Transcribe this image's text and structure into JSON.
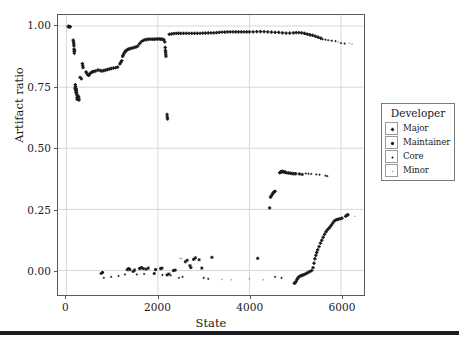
{
  "chart_data": {
    "type": "scatter",
    "title": "",
    "xlabel": "State",
    "ylabel": "Artifact ratio",
    "xlim": [
      -180,
      6500
    ],
    "ylim": [
      -0.1,
      1.045
    ],
    "xticks": [
      0,
      2000,
      4000,
      6000
    ],
    "xticklabels": [
      "0",
      "2000",
      "4000",
      "6000"
    ],
    "yticks": [
      0.0,
      0.25,
      0.5,
      0.75,
      1.0
    ],
    "yticklabels": [
      "0.00",
      "0.25",
      "0.50",
      "0.75",
      "1.00"
    ],
    "grid": true,
    "grid_color": "#d7d7d7",
    "marker_color": "#1a1a1a",
    "legend": {
      "title": "Developer",
      "position": "right-outside",
      "entries": [
        {
          "label": "Major",
          "marker": "plus-bold",
          "size": 3.2
        },
        {
          "label": "Maintainer",
          "marker": "asterisk",
          "size": 3.0
        },
        {
          "label": "Core",
          "marker": "plus-small",
          "size": 2.0
        },
        {
          "label": "Minor",
          "marker": "dot-faint",
          "size": 1.2
        }
      ]
    },
    "series": [
      {
        "name": "Major",
        "marker": "plus-bold",
        "points": [
          [
            40,
            0.998
          ],
          [
            55,
            0.998
          ],
          [
            70,
            0.997
          ],
          [
            85,
            0.997
          ],
          [
            150,
            0.942
          ],
          [
            158,
            0.935
          ],
          [
            162,
            0.927
          ],
          [
            166,
            0.919
          ],
          [
            168,
            0.905
          ],
          [
            172,
            0.897
          ],
          [
            175,
            0.889
          ],
          [
            196,
            0.76
          ],
          [
            200,
            0.752
          ],
          [
            204,
            0.744
          ],
          [
            208,
            0.736
          ],
          [
            212,
            0.728
          ],
          [
            216,
            0.742
          ],
          [
            220,
            0.735
          ],
          [
            224,
            0.727
          ],
          [
            228,
            0.719
          ],
          [
            236,
            0.7
          ],
          [
            268,
            0.712
          ],
          [
            272,
            0.704
          ],
          [
            276,
            0.697
          ],
          [
            350,
            0.846
          ],
          [
            358,
            0.838
          ],
          [
            366,
            0.83
          ],
          [
            430,
            0.812
          ],
          [
            450,
            0.806
          ],
          [
            470,
            0.8
          ],
          [
            492,
            0.798
          ],
          [
            520,
            0.806
          ],
          [
            548,
            0.81
          ],
          [
            572,
            0.813
          ],
          [
            600,
            0.814
          ],
          [
            640,
            0.816
          ],
          [
            690,
            0.82
          ],
          [
            740,
            0.818
          ],
          [
            780,
            0.816
          ],
          [
            820,
            0.818
          ],
          [
            860,
            0.82
          ],
          [
            900,
            0.822
          ],
          [
            940,
            0.824
          ],
          [
            980,
            0.826
          ],
          [
            1030,
            0.828
          ],
          [
            1080,
            0.83
          ],
          [
            1120,
            0.832
          ],
          [
            1170,
            0.845
          ],
          [
            1190,
            0.852
          ],
          [
            1210,
            0.858
          ],
          [
            1240,
            0.88
          ],
          [
            1260,
            0.888
          ],
          [
            1280,
            0.894
          ],
          [
            1310,
            0.9
          ],
          [
            1340,
            0.904
          ],
          [
            1370,
            0.906
          ],
          [
            1400,
            0.908
          ],
          [
            1440,
            0.91
          ],
          [
            1480,
            0.912
          ],
          [
            1520,
            0.914
          ],
          [
            1560,
            0.918
          ],
          [
            1600,
            0.928
          ],
          [
            1640,
            0.936
          ],
          [
            1680,
            0.941
          ],
          [
            1720,
            0.944
          ],
          [
            1760,
            0.945
          ],
          [
            1800,
            0.946
          ],
          [
            1840,
            0.946
          ],
          [
            1880,
            0.946
          ],
          [
            1920,
            0.946
          ],
          [
            1960,
            0.947
          ],
          [
            2000,
            0.947
          ],
          [
            2040,
            0.947
          ],
          [
            2070,
            0.946
          ],
          [
            2100,
            0.946
          ],
          [
            2130,
            0.944
          ],
          [
            2150,
            0.935
          ],
          [
            2160,
            0.912
          ],
          [
            2165,
            0.9
          ],
          [
            2168,
            0.893
          ],
          [
            2200,
            0.638
          ],
          [
            2205,
            0.628
          ],
          [
            2210,
            0.62
          ],
          [
            2250,
            0.966
          ],
          [
            2300,
            0.968
          ],
          [
            2350,
            0.969
          ],
          [
            2400,
            0.97
          ],
          [
            2450,
            0.97
          ],
          [
            2500,
            0.97
          ],
          [
            2560,
            0.97
          ],
          [
            2620,
            0.97
          ],
          [
            2680,
            0.97
          ],
          [
            2740,
            0.97
          ],
          [
            2800,
            0.97
          ],
          [
            2860,
            0.97
          ],
          [
            2920,
            0.97
          ],
          [
            2980,
            0.971
          ],
          [
            3040,
            0.971
          ],
          [
            3100,
            0.972
          ],
          [
            3160,
            0.972
          ],
          [
            3220,
            0.972
          ],
          [
            3280,
            0.973
          ],
          [
            3340,
            0.974
          ],
          [
            3400,
            0.975
          ],
          [
            3460,
            0.975
          ],
          [
            3520,
            0.976
          ],
          [
            3580,
            0.976
          ],
          [
            3640,
            0.976
          ],
          [
            3700,
            0.976
          ],
          [
            3760,
            0.976
          ],
          [
            3820,
            0.976
          ],
          [
            3880,
            0.976
          ],
          [
            3940,
            0.976
          ],
          [
            4000,
            0.976
          ],
          [
            4080,
            0.976
          ],
          [
            4160,
            0.977
          ],
          [
            4240,
            0.977
          ],
          [
            4320,
            0.977
          ],
          [
            4400,
            0.976
          ],
          [
            4480,
            0.975
          ],
          [
            4560,
            0.974
          ],
          [
            4640,
            0.974
          ],
          [
            4720,
            0.972
          ],
          [
            4800,
            0.971
          ],
          [
            4880,
            0.971
          ],
          [
            4960,
            0.972
          ],
          [
            5020,
            0.973
          ],
          [
            5080,
            0.973
          ],
          [
            5140,
            0.972
          ],
          [
            5200,
            0.97
          ],
          [
            5260,
            0.967
          ],
          [
            5320,
            0.964
          ],
          [
            5380,
            0.962
          ],
          [
            5440,
            0.958
          ],
          [
            5500,
            0.954
          ],
          [
            5560,
            0.95
          ],
          [
            4460,
            0.3
          ],
          [
            4480,
            0.306
          ],
          [
            4500,
            0.312
          ],
          [
            4520,
            0.318
          ],
          [
            4540,
            0.322
          ],
          [
            4560,
            0.324
          ],
          [
            4440,
            0.256
          ],
          [
            4660,
            0.4
          ],
          [
            4690,
            0.404
          ],
          [
            4720,
            0.406
          ],
          [
            4750,
            0.404
          ],
          [
            4780,
            0.402
          ],
          [
            4810,
            0.4
          ],
          [
            4850,
            0.399
          ],
          [
            4890,
            0.398
          ],
          [
            4930,
            0.397
          ],
          [
            4970,
            0.396
          ],
          [
            5010,
            0.396
          ],
          [
            4980,
            -0.052
          ],
          [
            5000,
            -0.05
          ],
          [
            5020,
            -0.044
          ],
          [
            5040,
            -0.036
          ],
          [
            5060,
            -0.03
          ],
          [
            5080,
            -0.026
          ],
          [
            5110,
            -0.022
          ],
          [
            5140,
            -0.02
          ],
          [
            5170,
            -0.018
          ],
          [
            5200,
            -0.016
          ],
          [
            5240,
            -0.012
          ],
          [
            5280,
            -0.008
          ],
          [
            5320,
            -0.004
          ],
          [
            5360,
            0.0
          ],
          [
            5390,
            0.012
          ],
          [
            5410,
            0.03
          ],
          [
            5430,
            0.048
          ],
          [
            5450,
            0.062
          ],
          [
            5470,
            0.074
          ],
          [
            5490,
            0.085
          ],
          [
            5520,
            0.098
          ],
          [
            5550,
            0.112
          ],
          [
            5580,
            0.124
          ],
          [
            5610,
            0.136
          ],
          [
            5640,
            0.148
          ],
          [
            5670,
            0.158
          ],
          [
            5700,
            0.166
          ],
          [
            5730,
            0.172
          ],
          [
            5760,
            0.178
          ],
          [
            5790,
            0.186
          ],
          [
            5820,
            0.194
          ],
          [
            5850,
            0.202
          ],
          [
            5880,
            0.206
          ],
          [
            5910,
            0.208
          ],
          [
            5940,
            0.21
          ],
          [
            5980,
            0.212
          ],
          [
            6020,
            0.214
          ],
          [
            6100,
            0.222
          ],
          [
            6130,
            0.226
          ],
          [
            6150,
            0.228
          ]
        ]
      },
      {
        "name": "Maintainer",
        "marker": "asterisk",
        "points": [
          [
            180,
            0.9
          ],
          [
            190,
            0.745
          ],
          [
            232,
            0.708
          ],
          [
            300,
            0.79
          ],
          [
            330,
            0.784
          ],
          [
            1230,
            0.876
          ],
          [
            1300,
            0.898
          ],
          [
            2172,
            0.884
          ],
          [
            2176,
            0.876
          ],
          [
            4680,
            0.402
          ],
          [
            4700,
            0.404
          ],
          [
            4740,
            0.403
          ],
          [
            5090,
            0.395
          ],
          [
            5150,
            0.393
          ],
          [
            760,
            -0.012
          ],
          [
            790,
            -0.008
          ],
          [
            1330,
            0.004
          ],
          [
            1360,
            0.008
          ],
          [
            1390,
            0.004
          ],
          [
            1460,
            -0.004
          ],
          [
            1490,
            0.002
          ],
          [
            1600,
            0.008
          ],
          [
            1640,
            0.012
          ],
          [
            1680,
            0.008
          ],
          [
            1740,
            0.006
          ],
          [
            1790,
            0.01
          ],
          [
            1920,
            -0.012
          ],
          [
            1950,
            0.004
          ],
          [
            2060,
            0.008
          ],
          [
            2090,
            0.01
          ],
          [
            2200,
            -0.018
          ],
          [
            2240,
            -0.014
          ],
          [
            2340,
            0.0
          ],
          [
            2380,
            0.002
          ],
          [
            2600,
            0.036
          ],
          [
            2640,
            0.042
          ],
          [
            2700,
            0.02
          ],
          [
            2720,
            0.012
          ],
          [
            2780,
            0.046
          ],
          [
            2820,
            0.052
          ],
          [
            2900,
            0.044
          ],
          [
            2960,
            0.01
          ],
          [
            3180,
            0.054
          ],
          [
            4180,
            0.05
          ]
        ]
      },
      {
        "name": "Core",
        "marker": "plus-small",
        "points": [
          [
            5220,
            0.968
          ],
          [
            5280,
            0.966
          ],
          [
            5340,
            0.962
          ],
          [
            5600,
            0.946
          ],
          [
            5660,
            0.944
          ],
          [
            5720,
            0.942
          ],
          [
            5800,
            0.94
          ],
          [
            5880,
            0.938
          ],
          [
            6000,
            0.93
          ],
          [
            6080,
            0.928
          ],
          [
            5230,
            0.397
          ],
          [
            5290,
            0.396
          ],
          [
            5350,
            0.395
          ],
          [
            5460,
            0.393
          ],
          [
            5530,
            0.392
          ],
          [
            5660,
            0.388
          ],
          [
            5700,
            0.386
          ],
          [
            820,
            -0.03
          ],
          [
            980,
            -0.026
          ],
          [
            1140,
            -0.022
          ],
          [
            1280,
            -0.016
          ],
          [
            1540,
            -0.016
          ],
          [
            1700,
            -0.014
          ],
          [
            2100,
            -0.018
          ],
          [
            2280,
            -0.02
          ],
          [
            2460,
            -0.03
          ],
          [
            2540,
            -0.026
          ],
          [
            3000,
            -0.03
          ],
          [
            3100,
            -0.034
          ],
          [
            4560,
            -0.026
          ],
          [
            4700,
            -0.03
          ]
        ]
      },
      {
        "name": "Minor",
        "marker": "dot-faint",
        "points": [
          [
            6180,
            0.93
          ],
          [
            6240,
            0.926
          ],
          [
            5780,
            0.94
          ],
          [
            5940,
            0.934
          ],
          [
            2480,
            0.05
          ],
          [
            2520,
            0.048
          ],
          [
            3400,
            -0.036
          ],
          [
            3600,
            -0.038
          ],
          [
            4000,
            -0.034
          ],
          [
            4300,
            -0.038
          ],
          [
            6300,
            0.222
          ]
        ]
      }
    ]
  },
  "figure": {
    "bottom_rule": true
  }
}
